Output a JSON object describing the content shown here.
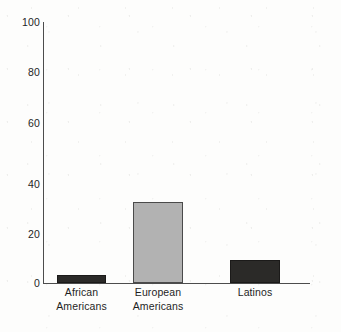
{
  "chart_data": {
    "type": "bar",
    "title": "",
    "subtitle": "",
    "xlabel": "",
    "ylabel": "",
    "categories": [
      "African Americans",
      "European Americans",
      "Latinos"
    ],
    "category_lines": [
      [
        "African",
        "Americans"
      ],
      [
        "European",
        "Americans"
      ],
      [
        "Latinos"
      ]
    ],
    "values": [
      3,
      31,
      9
    ],
    "series": [
      {
        "name": "",
        "values": [
          3,
          31,
          9
        ]
      }
    ],
    "ylim": [
      0,
      100
    ],
    "yticks": [
      0,
      20,
      40,
      60,
      80,
      100
    ],
    "ytick_labels": [
      "0",
      "20",
      "40",
      "60",
      "80",
      "100"
    ],
    "xticks": [],
    "grid": false,
    "legend": false,
    "legend_position": "none",
    "bar_colors": [
      "#2b2a28",
      "#b2b2b2",
      "#2b2a28"
    ],
    "bar_styles": [
      "dark",
      "light",
      "dark"
    ],
    "axis_color": "#4c4c4c",
    "background_color": "#fdfdfc",
    "annotations": []
  }
}
